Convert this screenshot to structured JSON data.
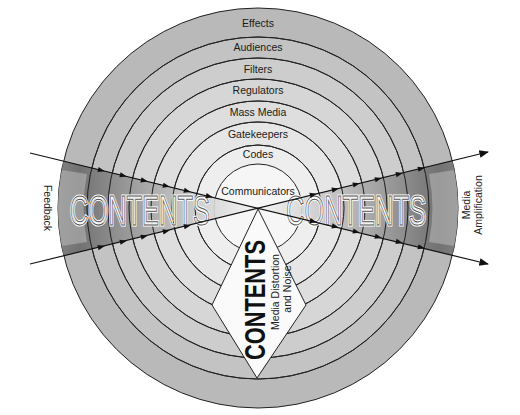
{
  "diagram": {
    "rings": [
      {
        "label": "Effects",
        "radius": 200,
        "fill": "#b9b9b9"
      },
      {
        "label": "Audiences",
        "radius": 171,
        "fill": "#c3c3c3"
      },
      {
        "label": "Filters",
        "radius": 150,
        "fill": "#cdcdcd"
      },
      {
        "label": "Regulators",
        "radius": 129,
        "fill": "#d6d6d6"
      },
      {
        "label": "Mass Media",
        "radius": 107,
        "fill": "#dedede"
      },
      {
        "label": "Gatekeepers",
        "radius": 86,
        "fill": "#e6e6e6"
      },
      {
        "label": "Codes",
        "radius": 63,
        "fill": "#eeeeee"
      },
      {
        "label": "Communicators",
        "radius": 44,
        "fill": "#f6f6f6"
      }
    ],
    "left_label": "Feedback",
    "right_label_line1": "Media",
    "right_label_line2": "Amplification",
    "left_contents": "CONTENTS",
    "right_contents": "CONTENTS",
    "bottom_contents": "CONTENTS",
    "bottom_sub_line1": "Media Distortion",
    "bottom_sub_line2": "and Noise",
    "colors": {
      "line": "#1a1a1a",
      "wedge_dark": "#6e6e6e",
      "wedge_light": "#e8e8e8",
      "diamond": "#fafafa"
    }
  }
}
